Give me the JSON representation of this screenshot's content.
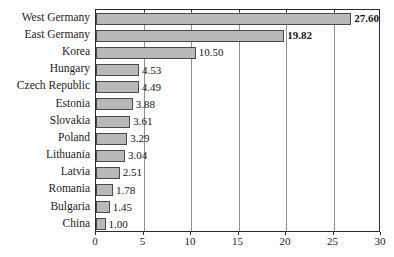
{
  "chart_data": {
    "type": "bar",
    "orientation": "horizontal",
    "title": "",
    "xlabel": "",
    "ylabel": "",
    "categories": [
      "West Germany",
      "East Germany",
      "Korea",
      "Hungary",
      "Czech Republic",
      "Estonia",
      "Slovakia",
      "Poland",
      "Lithuania",
      "Latvia",
      "Romania",
      "Bulgaria",
      "China"
    ],
    "values": [
      27.6,
      19.82,
      10.5,
      4.53,
      4.49,
      3.88,
      3.61,
      3.29,
      3.04,
      2.51,
      1.78,
      1.45,
      1.0
    ],
    "value_labels": [
      "27.60",
      "19.82",
      "10.50",
      "4.53",
      "4.49",
      "3.88",
      "3.61",
      "3.29",
      "3.04",
      "2.51",
      "1.78",
      "1.45",
      "1.00"
    ],
    "emphasized_labels": [
      "27.60",
      "19.82"
    ],
    "xlim": [
      0,
      30
    ],
    "xticks": [
      0,
      5,
      10,
      15,
      20,
      25,
      30
    ],
    "xtick_labels": [
      "0",
      "5",
      "10",
      "15",
      "20",
      "25",
      "30"
    ],
    "grid": true,
    "grid_axis": "x",
    "legend": null,
    "colors": {
      "bar_fill": "#b9b9b9",
      "bar_border": "#4a4a4a",
      "gridline": "#8e8e8e",
      "axis": "#2b2b2b",
      "background": "#ffffff",
      "text": "#1c1c1c"
    }
  }
}
